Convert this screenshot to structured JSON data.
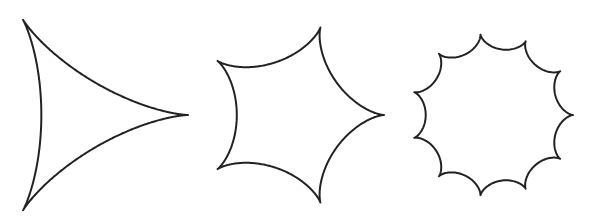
{
  "figure": {
    "width": 592,
    "height": 220,
    "background": "#ffffff",
    "stroke_color": "#222222",
    "stroke_width": 2
  },
  "shapes": [
    {
      "name": "deltoid-3-cusp-hypocycloid",
      "cusps": 3,
      "center": [
        78,
        115
      ],
      "radius": 110,
      "rotation_deg": 0
    },
    {
      "name": "5-cusp-hypocycloid",
      "cusps": 5,
      "center": [
        292,
        115
      ],
      "radius": 92,
      "rotation_deg": 0
    },
    {
      "name": "11-cusp-hypocycloid",
      "cusps": 11,
      "center": [
        492,
        115
      ],
      "radius": 81,
      "rotation_deg": 0
    }
  ]
}
